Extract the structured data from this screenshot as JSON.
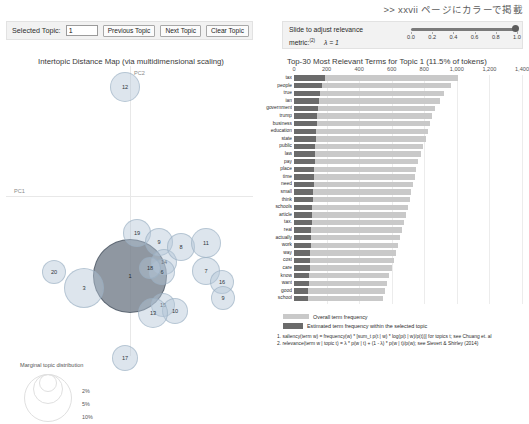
{
  "header": {
    "japanese_note": ">> xxvii ページにカラーで掲載"
  },
  "topic_bar": {
    "label": "Selected Topic:",
    "input_value": "1",
    "input_placeholder": "",
    "previous_label": "Previous Topic",
    "next_label": "Next Topic",
    "clear_label": "Clear Topic"
  },
  "relevance": {
    "line1": "Slide to adjust relevance",
    "line2_prefix": "metric:",
    "footnote_mark": "(2)",
    "lambda_text": "λ = 1",
    "value": 1.0,
    "ticks": [
      "0.0",
      "0.2",
      "0.4",
      "0.6",
      "0.8",
      "1.0"
    ]
  },
  "left_panel": {
    "title": "Intertopic Distance Map (via multidimensional scaling)",
    "axis_x_label": "PC1",
    "axis_y_label": "PC2",
    "marginal_legend": {
      "title": "Marginal topic distribution",
      "sizes": [
        "2%",
        "5%",
        "10%"
      ]
    }
  },
  "right_panel": {
    "title": "Top-30 Most Relevant Terms for Topic 1 (11.5% of tokens)"
  },
  "legend": {
    "overall_label": "Overall term frequency",
    "topic_label": "Estimated term frequency within the selected topic"
  },
  "footnotes": [
    "1. saliency(term w) = frequency(w) * [sum_t p(t | w) * log(p(t | w)/p(t))] for topics t; see Chuang et. al",
    "2. relevance(term w | topic t) = λ * p(w | t) + (1 - λ) * p(w | t)/p(w); see Sievert & Shirley (2014)"
  ],
  "chart_data": [
    {
      "type": "scatter",
      "name": "intertopic-distance-map",
      "title": "Intertopic Distance Map (via multidimensional scaling)",
      "xlabel": "PC1",
      "ylabel": "PC2",
      "grid": false,
      "legend_position": "bottom-left",
      "selected_topic": 1,
      "points": [
        {
          "topic": 1,
          "x": 124,
          "y": 210,
          "r": 37,
          "selected": true
        },
        {
          "topic": 12,
          "x": 119,
          "y": 21,
          "r": 15,
          "selected": false
        },
        {
          "topic": 19,
          "x": 131,
          "y": 167,
          "r": 14,
          "selected": false
        },
        {
          "topic": 9,
          "x": 153,
          "y": 176,
          "r": 14,
          "selected": false
        },
        {
          "topic": 14,
          "x": 158,
          "y": 196,
          "r": 13,
          "selected": false
        },
        {
          "topic": 8,
          "x": 175,
          "y": 181,
          "r": 14,
          "selected": false
        },
        {
          "topic": 6,
          "x": 156,
          "y": 206,
          "r": 13,
          "selected": false
        },
        {
          "topic": 11,
          "x": 200,
          "y": 177,
          "r": 15,
          "selected": false
        },
        {
          "topic": 7,
          "x": 200,
          "y": 205,
          "r": 14,
          "selected": false
        },
        {
          "topic": 16,
          "x": 216,
          "y": 216,
          "r": 12,
          "selected": false
        },
        {
          "topic": 9.2,
          "x": 217,
          "y": 232,
          "r": 12,
          "selected": false,
          "label": "9"
        },
        {
          "topic": 15,
          "x": 157,
          "y": 239,
          "r": 12,
          "selected": false
        },
        {
          "topic": 10,
          "x": 169,
          "y": 245,
          "r": 13,
          "selected": false
        },
        {
          "topic": 13,
          "x": 147,
          "y": 247,
          "r": 15,
          "selected": false
        },
        {
          "topic": 18,
          "x": 144,
          "y": 202,
          "r": 11,
          "selected": false
        },
        {
          "topic": 20,
          "x": 48,
          "y": 206,
          "r": 12,
          "selected": false
        },
        {
          "topic": 3,
          "x": 78,
          "y": 222,
          "r": 20,
          "selected": false
        },
        {
          "topic": 17,
          "x": 119,
          "y": 292,
          "r": 13,
          "selected": false
        }
      ]
    },
    {
      "type": "bar",
      "name": "top-terms-bar-chart",
      "orientation": "horizontal",
      "title": "Top-30 Most Relevant Terms for Topic 1 (11.5% of tokens)",
      "xlabel": "",
      "ylabel": "",
      "xlim": [
        0,
        1400
      ],
      "xticks": [
        "0",
        "200",
        "400",
        "600",
        "800",
        "1,000",
        "1,200",
        "1,400"
      ],
      "grid": true,
      "legend_position": "bottom",
      "categories": [
        "tax",
        "people",
        "true",
        "ian",
        "government",
        "trump",
        "business",
        "education",
        "state",
        "public",
        "law",
        "pay",
        "place",
        "time",
        "need",
        "small",
        "think",
        "schools",
        "article",
        "tax.",
        "real",
        "actually",
        "work",
        "way",
        "cost",
        "care",
        "know",
        "want",
        "good",
        "school"
      ],
      "series": [
        {
          "name": "Overall term frequency",
          "color": "#c9c9c9",
          "values": [
            1160,
            1110,
            1060,
            1030,
            995,
            975,
            965,
            950,
            930,
            915,
            900,
            880,
            865,
            855,
            840,
            830,
            820,
            805,
            790,
            775,
            765,
            750,
            735,
            720,
            705,
            690,
            675,
            660,
            645,
            630
          ]
        },
        {
          "name": "Estimated term frequency within the selected topic",
          "color": "#6b6b6b",
          "values": [
            220,
            200,
            185,
            175,
            170,
            165,
            160,
            158,
            155,
            150,
            148,
            145,
            142,
            140,
            138,
            135,
            132,
            130,
            128,
            125,
            122,
            120,
            118,
            115,
            112,
            110,
            108,
            105,
            102,
            100
          ]
        }
      ]
    }
  ]
}
